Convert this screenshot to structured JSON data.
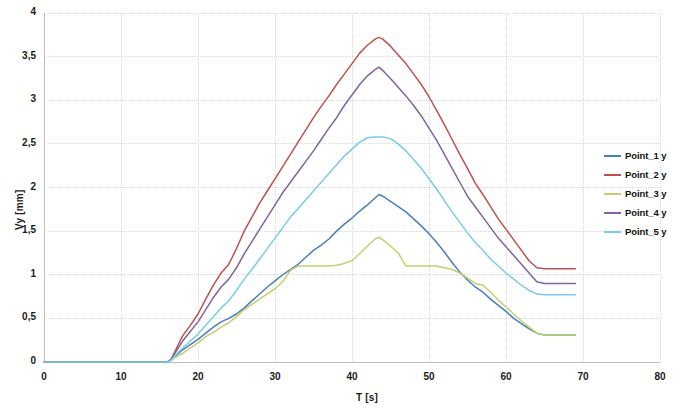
{
  "chart_data": {
    "type": "line",
    "title": "",
    "xlabel": "T [s]",
    "ylabel": "Vy [mm]",
    "xlim": [
      0,
      80
    ],
    "ylim": [
      0,
      4
    ],
    "xticks": [
      "0",
      "10",
      "20",
      "30",
      "40",
      "50",
      "60",
      "70",
      "80"
    ],
    "xtick_values": [
      0,
      10,
      20,
      30,
      40,
      50,
      60,
      70,
      80
    ],
    "yticks": [
      "0",
      "0,5",
      "1",
      "1,5",
      "2",
      "2,5",
      "3",
      "3,5",
      "4"
    ],
    "ytick_values": [
      0,
      0.5,
      1,
      1.5,
      2,
      2.5,
      3,
      3.5,
      4
    ],
    "grid": true,
    "legend_position": "right",
    "x": [
      0,
      2,
      4,
      6,
      8,
      10,
      12,
      14,
      16,
      16.5,
      17,
      18,
      19,
      20,
      21,
      22,
      23,
      24,
      25,
      26,
      27,
      28,
      29,
      30,
      31,
      32,
      33,
      34,
      35,
      36,
      37,
      38,
      39,
      40,
      41,
      42,
      43,
      43.5,
      44,
      45,
      46,
      47,
      48,
      49,
      50,
      51,
      52,
      53,
      54,
      55,
      56,
      57,
      58,
      59,
      60,
      61,
      62,
      63,
      64,
      65,
      66,
      67,
      68,
      69
    ],
    "series": [
      {
        "name": "Point_1 y",
        "color": "#4a7ebb",
        "values": [
          0,
          0,
          0,
          0,
          0,
          0,
          0,
          0,
          0,
          0.02,
          0.06,
          0.14,
          0.2,
          0.26,
          0.33,
          0.4,
          0.46,
          0.5,
          0.55,
          0.62,
          0.7,
          0.78,
          0.86,
          0.93,
          1.0,
          1.06,
          1.12,
          1.2,
          1.28,
          1.34,
          1.41,
          1.5,
          1.58,
          1.65,
          1.73,
          1.8,
          1.88,
          1.92,
          1.9,
          1.84,
          1.78,
          1.72,
          1.64,
          1.56,
          1.47,
          1.37,
          1.26,
          1.14,
          1.03,
          0.94,
          0.86,
          0.8,
          0.72,
          0.65,
          0.58,
          0.5,
          0.44,
          0.38,
          0.33,
          0.31,
          0.31,
          0.31,
          0.31,
          0.31
        ]
      },
      {
        "name": "Point_2 y",
        "color": "#c0504d",
        "values": [
          0,
          0,
          0,
          0,
          0,
          0,
          0,
          0,
          0,
          0.03,
          0.12,
          0.3,
          0.42,
          0.55,
          0.72,
          0.88,
          1.02,
          1.12,
          1.3,
          1.5,
          1.66,
          1.82,
          1.96,
          2.1,
          2.24,
          2.38,
          2.52,
          2.66,
          2.8,
          2.93,
          3.05,
          3.18,
          3.3,
          3.42,
          3.54,
          3.63,
          3.7,
          3.72,
          3.7,
          3.62,
          3.52,
          3.42,
          3.3,
          3.18,
          3.04,
          2.88,
          2.72,
          2.55,
          2.38,
          2.22,
          2.05,
          1.92,
          1.78,
          1.64,
          1.52,
          1.4,
          1.28,
          1.16,
          1.08,
          1.07,
          1.07,
          1.07,
          1.07,
          1.07
        ]
      },
      {
        "name": "Point_3 y",
        "color": "#c3cf6e",
        "values": [
          0,
          0,
          0,
          0,
          0,
          0,
          0,
          0,
          0,
          0.02,
          0.05,
          0.1,
          0.16,
          0.22,
          0.29,
          0.34,
          0.4,
          0.45,
          0.52,
          0.6,
          0.66,
          0.72,
          0.78,
          0.84,
          0.92,
          1.05,
          1.1,
          1.1,
          1.1,
          1.1,
          1.1,
          1.11,
          1.13,
          1.16,
          1.24,
          1.33,
          1.41,
          1.43,
          1.4,
          1.33,
          1.25,
          1.1,
          1.1,
          1.1,
          1.1,
          1.1,
          1.08,
          1.06,
          1.02,
          0.96,
          0.9,
          0.88,
          0.8,
          0.71,
          0.63,
          0.55,
          0.47,
          0.4,
          0.33,
          0.31,
          0.31,
          0.31,
          0.31,
          0.31
        ]
      },
      {
        "name": "Point_4 y",
        "color": "#8064a2",
        "values": [
          0,
          0,
          0,
          0,
          0,
          0,
          0,
          0,
          0,
          0.03,
          0.1,
          0.24,
          0.35,
          0.46,
          0.6,
          0.74,
          0.86,
          0.95,
          1.08,
          1.24,
          1.38,
          1.52,
          1.66,
          1.8,
          1.94,
          2.06,
          2.18,
          2.3,
          2.42,
          2.55,
          2.68,
          2.8,
          2.94,
          3.06,
          3.18,
          3.28,
          3.35,
          3.38,
          3.34,
          3.25,
          3.15,
          3.05,
          2.94,
          2.82,
          2.68,
          2.54,
          2.38,
          2.22,
          2.06,
          1.9,
          1.78,
          1.66,
          1.54,
          1.42,
          1.32,
          1.22,
          1.12,
          1.02,
          0.92,
          0.9,
          0.9,
          0.9,
          0.9,
          0.9
        ]
      },
      {
        "name": "Point_5 y",
        "color": "#79cbe8",
        "values": [
          0,
          0,
          0,
          0,
          0,
          0,
          0,
          0,
          0,
          0.02,
          0.07,
          0.16,
          0.24,
          0.32,
          0.42,
          0.52,
          0.62,
          0.7,
          0.82,
          0.95,
          1.06,
          1.18,
          1.3,
          1.42,
          1.54,
          1.66,
          1.76,
          1.86,
          1.96,
          2.06,
          2.16,
          2.26,
          2.36,
          2.44,
          2.52,
          2.57,
          2.58,
          2.58,
          2.58,
          2.56,
          2.5,
          2.42,
          2.32,
          2.22,
          2.1,
          1.98,
          1.85,
          1.72,
          1.6,
          1.48,
          1.37,
          1.28,
          1.18,
          1.1,
          1.02,
          0.95,
          0.88,
          0.82,
          0.78,
          0.77,
          0.77,
          0.77,
          0.77,
          0.77
        ]
      }
    ]
  },
  "legend": {
    "items": [
      {
        "label": "Point_1 y",
        "color": "#4a7ebb"
      },
      {
        "label": "Point_2 y",
        "color": "#c0504d"
      },
      {
        "label": "Point_3 y",
        "color": "#c3cf6e"
      },
      {
        "label": "Point_4 y",
        "color": "#8064a2"
      },
      {
        "label": "Point_5 y",
        "color": "#79cbe8"
      }
    ]
  },
  "style": {
    "grid_color": "#d9d9d9",
    "axis_color": "#bfbfbf",
    "text_color": "#1a1a1a",
    "background": "#ffffff"
  }
}
